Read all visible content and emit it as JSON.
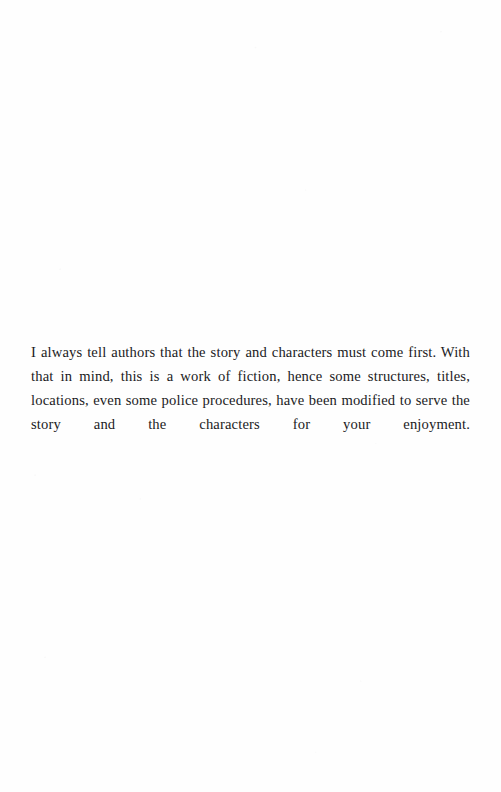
{
  "page": {
    "width": 501,
    "height": 792,
    "background_color": "#fefefe",
    "text_color": "#1b1b1d",
    "kind": "scanned-book-page",
    "header": "",
    "footer": "",
    "page_number": ""
  },
  "content": {
    "paragraphs": [
      {
        "text": "I always tell authors that the story and characters must come first. With that in mind, this is a work of fiction, hence some structures, titles, locations, even some police procedures, have been modified to serve the story and the characters for your enjoyment.",
        "lines": [
          "I always tell authors that the story and characters must come first. With that",
          "in mind, this is a work of fiction, hence some structures, titles, locations,",
          "even some police procedures, have been modified to serve the story and the",
          "characters for your enjoyment."
        ],
        "alignment": "justify",
        "first_line_indent": "none"
      }
    ]
  }
}
